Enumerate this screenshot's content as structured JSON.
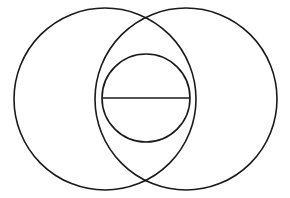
{
  "figure": {
    "background_color": "#ffffff",
    "stroke_color": "#1a1a1a",
    "stroke_width": 1.6,
    "canvas": {
      "width": 290,
      "height": 198
    },
    "shapes": [
      {
        "name": "left-large-circle",
        "type": "circle",
        "cx": 105,
        "cy": 99,
        "r": 91
      },
      {
        "name": "right-large-circle",
        "type": "circle",
        "cx": 186,
        "cy": 99,
        "r": 91
      },
      {
        "name": "inner-small-circle",
        "type": "circle",
        "cx": 146,
        "cy": 98,
        "r": 44
      },
      {
        "name": "horizontal-diameter-line",
        "type": "line",
        "x1": 102,
        "y1": 98,
        "x2": 190,
        "y2": 98
      }
    ],
    "intersections": [
      {
        "name": "upper-intersection-point",
        "x": 148,
        "y": 21
      },
      {
        "name": "lower-intersection-point",
        "x": 146,
        "y": 177
      }
    ]
  }
}
